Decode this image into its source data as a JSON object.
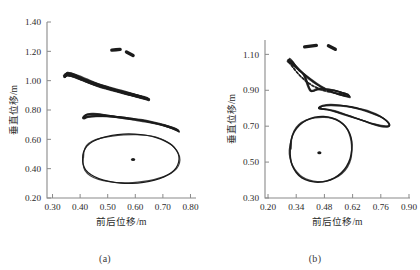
{
  "figure": {
    "panels": [
      {
        "id": "a",
        "caption": "(a)",
        "xlabel": "前后位移/m",
        "ylabel": "垂直位移/m",
        "xticks": [
          "0.30",
          "0.40",
          "0.50",
          "0.60",
          "0.70",
          "0.80"
        ],
        "yticks": [
          "0.20",
          "0.40",
          "0.60",
          "0.80",
          "1.00",
          "1.20",
          "1.40"
        ]
      },
      {
        "id": "b",
        "caption": "(b)",
        "xlabel": "前后位移/m",
        "ylabel": "垂直位移/m",
        "xticks": [
          "0.20",
          "0.34",
          "0.48",
          "0.62",
          "0.76",
          "0.90"
        ],
        "yticks": [
          "0.30",
          "0.50",
          "0.70",
          "0.90",
          "1.10"
        ]
      }
    ]
  },
  "chart_data": [
    {
      "type": "line",
      "panel": "a",
      "title": "",
      "xlabel": "前后位移/m",
      "ylabel": "垂直位移/m",
      "xlim": [
        0.28,
        0.82
      ],
      "ylim": [
        0.2,
        1.4
      ],
      "xticks": [
        0.3,
        0.4,
        0.5,
        0.6,
        0.7,
        0.8
      ],
      "yticks": [
        0.2,
        0.4,
        0.6,
        0.8,
        1.0,
        1.2,
        1.4
      ],
      "grid": false,
      "legend": "none",
      "series": [
        {
          "name": "upper-descending-loop",
          "comment": "thick closed trajectory loop from upper-left descending to the right",
          "points": [
            [
              0.347,
              1.03
            ],
            [
              0.352,
              1.048
            ],
            [
              0.368,
              1.045
            ],
            [
              0.392,
              1.028
            ],
            [
              0.424,
              1.002
            ],
            [
              0.462,
              0.975
            ],
            [
              0.505,
              0.95
            ],
            [
              0.548,
              0.927
            ],
            [
              0.59,
              0.906
            ],
            [
              0.622,
              0.89
            ],
            [
              0.64,
              0.88
            ],
            [
              0.648,
              0.872
            ],
            [
              0.636,
              0.878
            ],
            [
              0.6,
              0.896
            ],
            [
              0.556,
              0.918
            ],
            [
              0.51,
              0.942
            ],
            [
              0.466,
              0.966
            ],
            [
              0.428,
              0.992
            ],
            [
              0.396,
              1.016
            ],
            [
              0.368,
              1.034
            ],
            [
              0.35,
              1.04
            ],
            [
              0.344,
              1.03
            ]
          ]
        },
        {
          "name": "middle-thin-loop",
          "comment": "narrow elongated loop near y=0.75 descending to the right",
          "points": [
            [
              0.412,
              0.752
            ],
            [
              0.424,
              0.768
            ],
            [
              0.45,
              0.772
            ],
            [
              0.488,
              0.766
            ],
            [
              0.53,
              0.756
            ],
            [
              0.578,
              0.744
            ],
            [
              0.625,
              0.73
            ],
            [
              0.668,
              0.713
            ],
            [
              0.706,
              0.696
            ],
            [
              0.734,
              0.68
            ],
            [
              0.752,
              0.666
            ],
            [
              0.758,
              0.654
            ],
            [
              0.748,
              0.664
            ],
            [
              0.72,
              0.684
            ],
            [
              0.684,
              0.704
            ],
            [
              0.64,
              0.722
            ],
            [
              0.592,
              0.736
            ],
            [
              0.544,
              0.748
            ],
            [
              0.496,
              0.756
            ],
            [
              0.456,
              0.758
            ],
            [
              0.428,
              0.754
            ],
            [
              0.414,
              0.744
            ],
            [
              0.412,
              0.752
            ]
          ]
        },
        {
          "name": "large-ellipse-loop",
          "comment": "large closed loop centered near (0.59, 0.46)",
          "points": [
            [
              0.409,
              0.47
            ],
            [
              0.412,
              0.51
            ],
            [
              0.424,
              0.552
            ],
            [
              0.446,
              0.585
            ],
            [
              0.478,
              0.61
            ],
            [
              0.516,
              0.627
            ],
            [
              0.556,
              0.636
            ],
            [
              0.598,
              0.636
            ],
            [
              0.638,
              0.628
            ],
            [
              0.676,
              0.612
            ],
            [
              0.708,
              0.588
            ],
            [
              0.734,
              0.558
            ],
            [
              0.75,
              0.522
            ],
            [
              0.758,
              0.484
            ],
            [
              0.757,
              0.444
            ],
            [
              0.748,
              0.406
            ],
            [
              0.73,
              0.372
            ],
            [
              0.704,
              0.344
            ],
            [
              0.67,
              0.322
            ],
            [
              0.63,
              0.307
            ],
            [
              0.588,
              0.3
            ],
            [
              0.546,
              0.302
            ],
            [
              0.505,
              0.313
            ],
            [
              0.468,
              0.332
            ],
            [
              0.44,
              0.358
            ],
            [
              0.42,
              0.392
            ],
            [
              0.411,
              0.43
            ],
            [
              0.409,
              0.47
            ]
          ]
        },
        {
          "name": "center-dot",
          "comment": "small dark marker at loop centroid",
          "points": [
            [
              0.592,
              0.462
            ]
          ]
        },
        {
          "name": "upper-blob-left",
          "comment": "small dark streak near top",
          "points": [
            [
              0.515,
              1.208
            ],
            [
              0.545,
              1.213
            ]
          ]
        },
        {
          "name": "upper-blob-right",
          "comment": "small dark wedge near top",
          "points": [
            [
              0.568,
              1.196
            ],
            [
              0.592,
              1.172
            ]
          ]
        }
      ]
    },
    {
      "type": "line",
      "panel": "b",
      "title": "",
      "xlabel": "前后位移/m",
      "ylabel": "垂直位移/m",
      "xlim": [
        0.185,
        0.905
      ],
      "ylim": [
        0.3,
        1.18
      ],
      "xticks": [
        0.2,
        0.34,
        0.48,
        0.62,
        0.76,
        0.9
      ],
      "yticks": [
        0.3,
        0.5,
        0.7,
        0.9,
        1.1
      ],
      "grid": false,
      "legend": "none",
      "series": [
        {
          "name": "upper-crescent-loop",
          "comment": "crescent shaped closed loop from (0.30,1.07) sweeping down to (0.60,0.86)",
          "points": [
            [
              0.3,
              1.062
            ],
            [
              0.306,
              1.072
            ],
            [
              0.322,
              1.058
            ],
            [
              0.344,
              1.03
            ],
            [
              0.372,
              0.998
            ],
            [
              0.404,
              0.966
            ],
            [
              0.44,
              0.936
            ],
            [
              0.478,
              0.91
            ],
            [
              0.516,
              0.89
            ],
            [
              0.552,
              0.876
            ],
            [
              0.584,
              0.868
            ],
            [
              0.604,
              0.864
            ],
            [
              0.596,
              0.876
            ],
            [
              0.566,
              0.888
            ],
            [
              0.528,
              0.9
            ],
            [
              0.488,
              0.906
            ],
            [
              0.448,
              0.906
            ],
            [
              0.412,
              0.898
            ],
            [
              0.38,
              0.982
            ],
            [
              0.352,
              1.012
            ],
            [
              0.326,
              1.04
            ],
            [
              0.306,
              1.058
            ],
            [
              0.3,
              1.062
            ]
          ]
        },
        {
          "name": "upper-crescent-inner",
          "comment": "inner dashed-looking return path of crescent",
          "points": [
            [
              0.302,
              1.056
            ],
            [
              0.318,
              1.034
            ],
            [
              0.34,
              1.004
            ],
            [
              0.366,
              0.974
            ],
            [
              0.396,
              0.946
            ],
            [
              0.43,
              0.922
            ],
            [
              0.466,
              0.904
            ],
            [
              0.502,
              0.892
            ],
            [
              0.538,
              0.884
            ],
            [
              0.572,
              0.878
            ],
            [
              0.596,
              0.872
            ]
          ]
        },
        {
          "name": "middle-lens-loop",
          "comment": "elongated lens loop from (0.46,0.80) to (0.80,0.70)",
          "points": [
            [
              0.452,
              0.8
            ],
            [
              0.47,
              0.812
            ],
            [
              0.512,
              0.818
            ],
            [
              0.56,
              0.816
            ],
            [
              0.612,
              0.808
            ],
            [
              0.664,
              0.794
            ],
            [
              0.712,
              0.776
            ],
            [
              0.756,
              0.754
            ],
            [
              0.788,
              0.73
            ],
            [
              0.804,
              0.708
            ],
            [
              0.796,
              0.698
            ],
            [
              0.764,
              0.7
            ],
            [
              0.722,
              0.712
            ],
            [
              0.676,
              0.73
            ],
            [
              0.628,
              0.748
            ],
            [
              0.58,
              0.766
            ],
            [
              0.534,
              0.782
            ],
            [
              0.494,
              0.792
            ],
            [
              0.464,
              0.796
            ],
            [
              0.452,
              0.8
            ]
          ]
        },
        {
          "name": "large-circle-loop",
          "comment": "near circular closed loop centered near (0.455, 0.555)",
          "points": [
            [
              0.31,
              0.57
            ],
            [
              0.314,
              0.62
            ],
            [
              0.33,
              0.668
            ],
            [
              0.356,
              0.706
            ],
            [
              0.392,
              0.734
            ],
            [
              0.432,
              0.75
            ],
            [
              0.476,
              0.754
            ],
            [
              0.518,
              0.746
            ],
            [
              0.556,
              0.726
            ],
            [
              0.586,
              0.696
            ],
            [
              0.606,
              0.658
            ],
            [
              0.616,
              0.614
            ],
            [
              0.616,
              0.568
            ],
            [
              0.608,
              0.52
            ],
            [
              0.59,
              0.476
            ],
            [
              0.564,
              0.44
            ],
            [
              0.53,
              0.412
            ],
            [
              0.49,
              0.394
            ],
            [
              0.448,
              0.388
            ],
            [
              0.406,
              0.394
            ],
            [
              0.368,
              0.412
            ],
            [
              0.34,
              0.442
            ],
            [
              0.32,
              0.482
            ],
            [
              0.311,
              0.526
            ],
            [
              0.31,
              0.57
            ]
          ]
        },
        {
          "name": "center-dot",
          "comment": "small dark marker at loop centroid",
          "points": [
            [
              0.455,
              0.552
            ]
          ]
        },
        {
          "name": "upper-blob-left",
          "comment": "small dark streak near top",
          "points": [
            [
              0.382,
              1.142
            ],
            [
              0.44,
              1.15
            ]
          ]
        },
        {
          "name": "upper-blob-right",
          "comment": "small dark wedge near top",
          "points": [
            [
              0.5,
              1.148
            ],
            [
              0.534,
              1.128
            ]
          ]
        }
      ]
    }
  ]
}
